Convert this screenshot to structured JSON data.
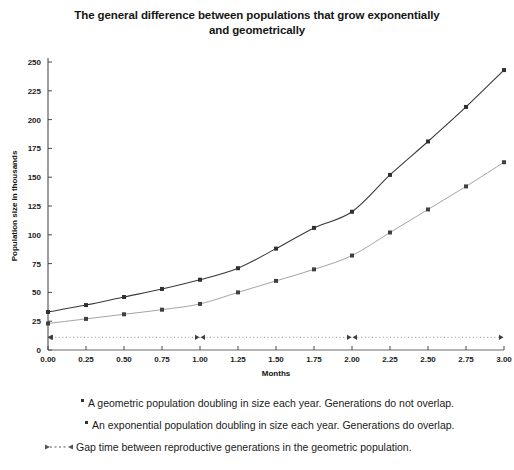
{
  "chart_data": {
    "type": "line",
    "title": "The general difference between populations that grow exponentially and geometrically",
    "title_line1": "The general difference between populations that grow exponentially",
    "title_line2": "and geometrically",
    "xlabel": "Months",
    "ylabel": "Population size in thousands",
    "xlim": [
      0.0,
      3.0
    ],
    "ylim": [
      0,
      250
    ],
    "grid": false,
    "legend_position": "below",
    "x": [
      0.0,
      0.25,
      0.5,
      0.75,
      1.0,
      1.25,
      1.5,
      1.75,
      2.0,
      2.25,
      2.5,
      2.75,
      3.0
    ],
    "xticks": [
      "0.00",
      "0.25",
      "0.50",
      "0.75",
      "1.00",
      "1.25",
      "1.50",
      "1.75",
      "2.00",
      "2.25",
      "2.50",
      "2.75",
      "3.00"
    ],
    "yticks": [
      "0",
      "25",
      "50",
      "75",
      "100",
      "125",
      "150",
      "175",
      "200",
      "225",
      "250"
    ],
    "series": [
      {
        "name": "An exponential population doubling in size each year. Generations do overlap.",
        "values": [
          33,
          39,
          46,
          53,
          61,
          71,
          88,
          106,
          120,
          152,
          181,
          211,
          243
        ],
        "color": "#3a3a3a",
        "style": "solid",
        "marker": "square"
      },
      {
        "name": "A geometric population doubling in size each year. Generations do not overlap.",
        "values": [
          23,
          27,
          31,
          35,
          40,
          50,
          60,
          70,
          82,
          102,
          122,
          142,
          163
        ],
        "color": "#9a9a9a",
        "style": "solid",
        "marker": "square"
      },
      {
        "name": "Gap time between reproductive generations in the geometric population.",
        "values": [
          11,
          11,
          11,
          11,
          11,
          11,
          11,
          11,
          11,
          11,
          11,
          11,
          11
        ],
        "color": "#808080",
        "style": "dotted",
        "marker": "arrow"
      }
    ],
    "annotations": [
      {
        "type": "gap-arrow",
        "x": 0.0
      },
      {
        "type": "gap-arrow",
        "x": 1.0
      },
      {
        "type": "gap-arrow",
        "x": 2.0
      },
      {
        "type": "gap-arrow",
        "x": 3.0
      }
    ]
  },
  "legend": {
    "items": [
      {
        "marker": "dot-marker",
        "text": "A geometric population doubling in size each year. Generations do not overlap."
      },
      {
        "marker": "dot-marker",
        "text": "An exponential population doubling in size each year. Generations do overlap."
      },
      {
        "marker": "gap-arrow-marker",
        "text": "Gap time between reproductive generations in the geometric population."
      }
    ]
  }
}
